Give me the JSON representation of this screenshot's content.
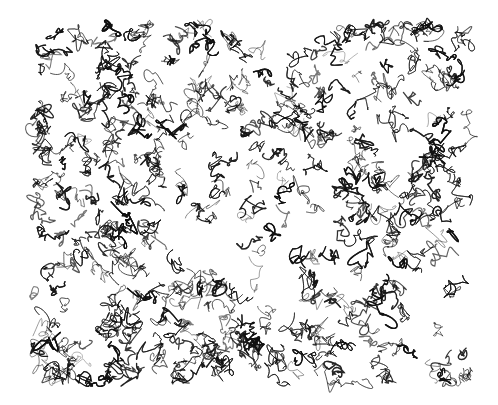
{
  "artwork": {
    "description": "Dense black ink scribble drawing on white background",
    "background_color": "#ffffff",
    "ink_color": "#111111",
    "bounds": {
      "left": 33,
      "top": 25,
      "right": 470,
      "bottom": 383
    },
    "center_lighter": true
  }
}
